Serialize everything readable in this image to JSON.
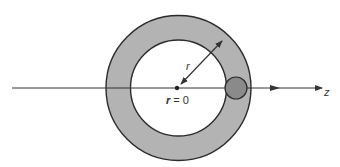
{
  "diagram": {
    "labels": {
      "radius": "r",
      "center": "r = 0",
      "center_var": "r",
      "center_eq": " = 0",
      "axis": "z"
    },
    "colors": {
      "ring_fill": "#b3b3b3",
      "ring_stroke": "#2b2b2b",
      "inner_fill": "#ffffff",
      "particle_fill": "#8a8a8a",
      "line": "#333333"
    }
  }
}
